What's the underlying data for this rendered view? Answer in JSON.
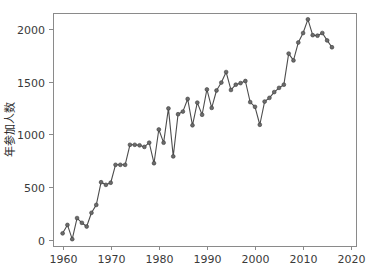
{
  "chart_data": {
    "type": "line",
    "title": "",
    "subtitle": "",
    "xlabel": "",
    "ylabel": "年参加人数",
    "xlim": [
      1958,
      2021
    ],
    "ylim": [
      -60,
      2150
    ],
    "xticks": [
      1960,
      1970,
      1980,
      1990,
      2000,
      2010,
      2020
    ],
    "yticks": [
      0,
      500,
      1000,
      1500,
      2000
    ],
    "xtick_labels": [
      "1960",
      "1970",
      "1980",
      "1990",
      "2000",
      "2010",
      "2020"
    ],
    "ytick_labels": [
      "0",
      "500",
      "1000",
      "1500",
      "2000"
    ],
    "grid": false,
    "legend": null,
    "legend_position": "none",
    "marker": "circle",
    "line_color": "#4d4d4d",
    "marker_color": "#6b6b6b",
    "frame_color": "#8a8a8a",
    "background_color": "#ffffff",
    "x": [
      1960,
      1961,
      1962,
      1963,
      1964,
      1965,
      1966,
      1967,
      1968,
      1969,
      1970,
      1971,
      1972,
      1973,
      1974,
      1975,
      1976,
      1977,
      1978,
      1979,
      1980,
      1981,
      1982,
      1983,
      1984,
      1985,
      1986,
      1987,
      1988,
      1989,
      1990,
      1991,
      1992,
      1993,
      1994,
      1995,
      1996,
      1997,
      1998,
      1999,
      2000,
      2001,
      2002,
      2003,
      2004,
      2005,
      2006,
      2007,
      2008,
      2009,
      2010,
      2011,
      2012,
      2013,
      2014,
      2015,
      2016
    ],
    "values": [
      60,
      140,
      5,
      205,
      160,
      125,
      255,
      330,
      545,
      520,
      540,
      710,
      710,
      710,
      900,
      900,
      895,
      880,
      920,
      725,
      1045,
      920,
      1245,
      790,
      1190,
      1215,
      1335,
      1085,
      1300,
      1185,
      1425,
      1250,
      1415,
      1490,
      1590,
      1420,
      1470,
      1485,
      1505,
      1305,
      1260,
      1090,
      1310,
      1345,
      1400,
      1440,
      1470,
      1765,
      1700,
      1870,
      1960,
      2090,
      1940,
      1935,
      1960,
      1890,
      1825
    ],
    "series": [
      {
        "name": "年参加人数",
        "values": [
          60,
          140,
          5,
          205,
          160,
          125,
          255,
          330,
          545,
          520,
          540,
          710,
          710,
          710,
          900,
          900,
          895,
          880,
          920,
          725,
          1045,
          920,
          1245,
          790,
          1190,
          1215,
          1335,
          1085,
          1300,
          1185,
          1425,
          1250,
          1415,
          1490,
          1590,
          1420,
          1470,
          1485,
          1505,
          1305,
          1260,
          1090,
          1310,
          1345,
          1400,
          1440,
          1470,
          1765,
          1700,
          1870,
          1960,
          2090,
          1940,
          1935,
          1960,
          1890,
          1825
        ]
      }
    ]
  }
}
